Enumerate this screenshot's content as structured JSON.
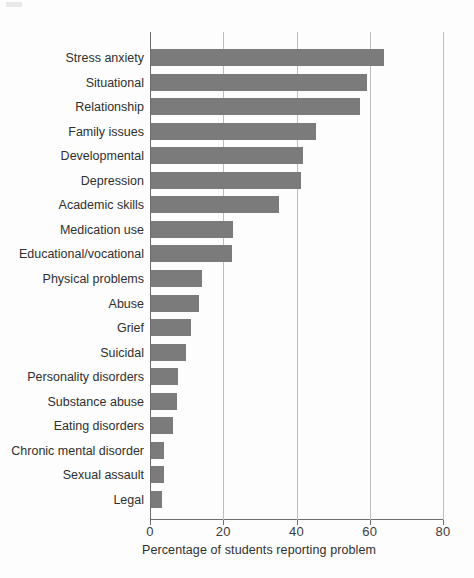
{
  "chart_data": {
    "type": "bar",
    "orientation": "horizontal",
    "title": "",
    "xlabel": "Percentage of students reporting problem",
    "ylabel": "",
    "xlim": [
      0,
      80
    ],
    "xticks": [
      0,
      20,
      40,
      60,
      80
    ],
    "xtick_labels": [
      "0",
      "20",
      "40",
      "60",
      "80"
    ],
    "grid": "vertical",
    "legend": "none",
    "bar_color": "#7b7b7b",
    "background_color": "#fdfdfd",
    "axis_color": "#6e6e6e",
    "gridline_color": "#bdbdbd",
    "categories": [
      "Stress anxiety",
      "Situational",
      "Relationship",
      "Family issues",
      "Developmental",
      "Depression",
      "Academic skills",
      "Medication use",
      "Educational/vocational",
      "Physical problems",
      "Abuse",
      "Grief",
      "Suicidal",
      "Personality disorders",
      "Substance abuse",
      "Eating disorders",
      "Chronic mental disorder",
      "Sexual assault",
      "Legal"
    ],
    "values": [
      63.5,
      59,
      57,
      45,
      41.5,
      41,
      35,
      22.5,
      22,
      14,
      13,
      11,
      9.5,
      7.5,
      7,
      6,
      3.5,
      3.5,
      3
    ]
  }
}
